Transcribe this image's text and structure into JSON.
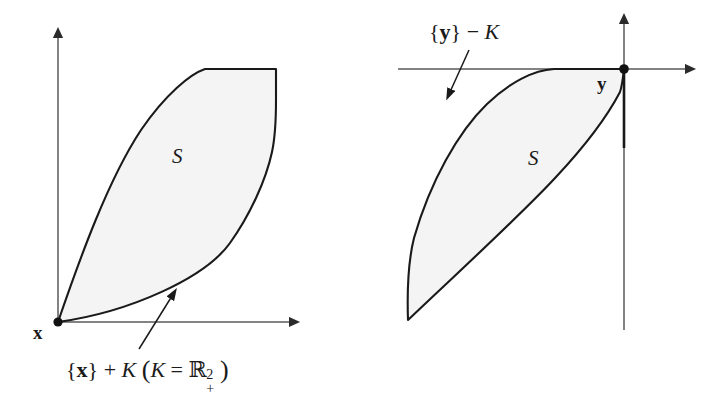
{
  "figure": {
    "kind": "diagram",
    "background_color": "#ffffff",
    "ink_color": "#1a1a1a",
    "axis_color": "#555555",
    "region_fill_color": "#f4f4f4",
    "region_stroke_color": "#1a1a1a"
  },
  "panels": [
    {
      "id": "left-panel",
      "name": "minimum-element-panel",
      "origin_label": "x",
      "region_label": "S",
      "annotation": {
        "prefix_brace_open": "{",
        "vector": "x",
        "prefix_brace_close": "}",
        "operator": "+",
        "cone": "K",
        "paren_open": "(",
        "cone_repeat": "K",
        "equals": "=",
        "blackboard_r": "ℝ",
        "superscript": "2",
        "subscript": "+",
        "paren_close": ")",
        "full_text": "{x} + K (K = ℝ²₊)"
      }
    },
    {
      "id": "right-panel",
      "name": "maximum-element-panel",
      "origin_label": "y",
      "region_label": "S",
      "annotation": {
        "prefix_brace_open": "{",
        "vector": "y",
        "prefix_brace_close": "}",
        "operator": "−",
        "cone": "K",
        "full_text": "{y} − K"
      }
    }
  ]
}
